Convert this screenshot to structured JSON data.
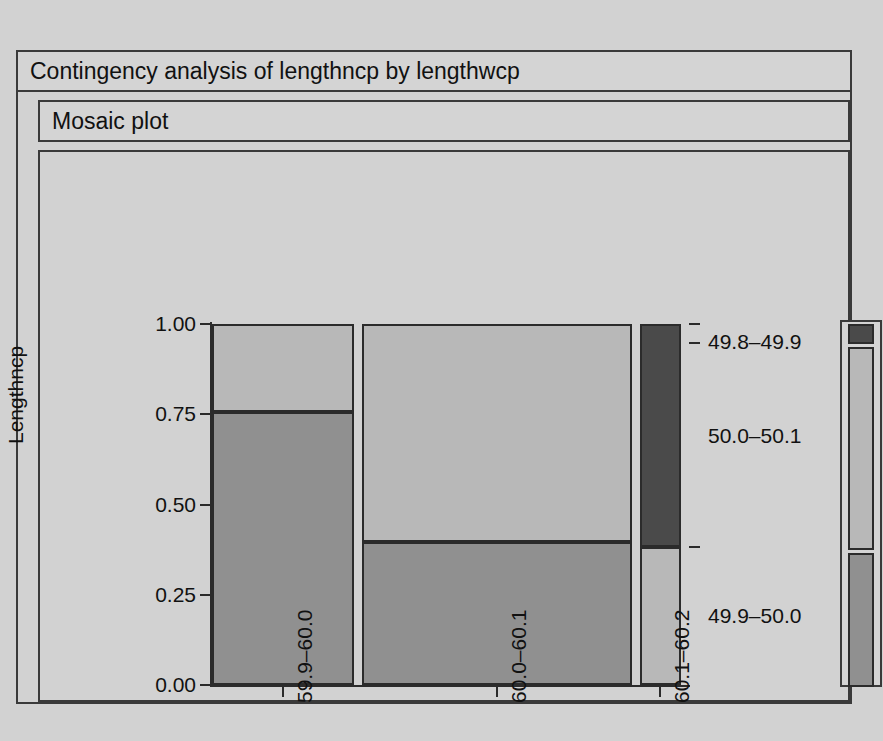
{
  "window": {
    "title": "Contingency analysis of lengthncp by lengthwcp",
    "section_title": "Mosaic plot"
  },
  "chart_data": {
    "type": "mosaic",
    "title": "Contingency analysis of lengthncp by lengthwcp",
    "subtitle": "Mosaic plot",
    "xlabel": "Lengthwcp",
    "ylabel": "Lengthncp",
    "categories": [
      "59.9–60.0",
      "60.0–60.1",
      "60.1–60.2"
    ],
    "row_categories": [
      "49.8–49.9",
      "49.9–50.0",
      "50.0–50.1"
    ],
    "ytick_labels": [
      "0.00",
      "0.25",
      "0.50",
      "0.75",
      "1.00"
    ],
    "ylim": [
      0,
      1
    ],
    "grid": false,
    "legend_position": "right",
    "column_widths": [
      0.308,
      0.587,
      0.09
    ],
    "colors": {
      "row_49_8_49_9": "#909090",
      "row_49_9_50_0": "#b8b8b8",
      "row_50_0_50_1": "#4a4a4a",
      "background": "#d2d2d2",
      "outline": "#2b2b2b"
    },
    "tiles": [
      {
        "column": "59.9–60.0",
        "row": "49.8–49.9",
        "y0": 0.0,
        "y1": 0.757,
        "color": "#909090"
      },
      {
        "column": "59.9–60.0",
        "row": "49.9–50.0",
        "y0": 0.757,
        "y1": 1.0,
        "color": "#b8b8b8"
      },
      {
        "column": "59.9–60.0",
        "row": "50.0–50.1",
        "y0": 1.0,
        "y1": 1.0,
        "color": "#4a4a4a"
      },
      {
        "column": "60.0–60.1",
        "row": "49.8–49.9",
        "y0": 0.0,
        "y1": 0.397,
        "color": "#909090"
      },
      {
        "column": "60.0–60.1",
        "row": "49.9–50.0",
        "y0": 0.397,
        "y1": 1.0,
        "color": "#b8b8b8"
      },
      {
        "column": "60.0–60.1",
        "row": "50.0–50.1",
        "y0": 1.0,
        "y1": 1.0,
        "color": "#4a4a4a"
      },
      {
        "column": "60.1–60.2",
        "row": "49.8–49.9",
        "y0": 0.0,
        "y1": 0.0,
        "color": "#909090"
      },
      {
        "column": "60.1–60.2",
        "row": "49.9–50.0",
        "y0": 0.0,
        "y1": 0.382,
        "color": "#b8b8b8"
      },
      {
        "column": "60.1–60.2",
        "row": "50.0–50.1",
        "y0": 0.382,
        "y1": 1.0,
        "color": "#4a4a4a"
      }
    ],
    "legend_segments": [
      {
        "label": "50.0–50.1",
        "color": "#4a4a4a",
        "top": 0.0,
        "height": 0.055
      },
      {
        "label": "49.9–50.0",
        "color": "#b8b8b8",
        "top": 0.062,
        "height": 0.56
      },
      {
        "label": "49.8–49.9",
        "color": "#909090",
        "top": 0.632,
        "height": 0.368
      }
    ]
  },
  "axis": {
    "y_title": "Lengthncp",
    "x_title": "Lengthwcp",
    "y_ticks": [
      {
        "label": "1.00",
        "value": 1.0
      },
      {
        "label": "0.75",
        "value": 0.75
      },
      {
        "label": "0.50",
        "value": 0.5
      },
      {
        "label": "0.25",
        "value": 0.25
      },
      {
        "label": "0.00",
        "value": 0.0
      }
    ],
    "x_ticks": [
      {
        "label": "59.9–60.0"
      },
      {
        "label": "60.0–60.1"
      },
      {
        "label": "60.1–60.2"
      }
    ],
    "row_labels": [
      {
        "label": "50.0–50.1"
      },
      {
        "label": "49.9–50.0"
      },
      {
        "label": "49.8–49.9"
      }
    ]
  }
}
